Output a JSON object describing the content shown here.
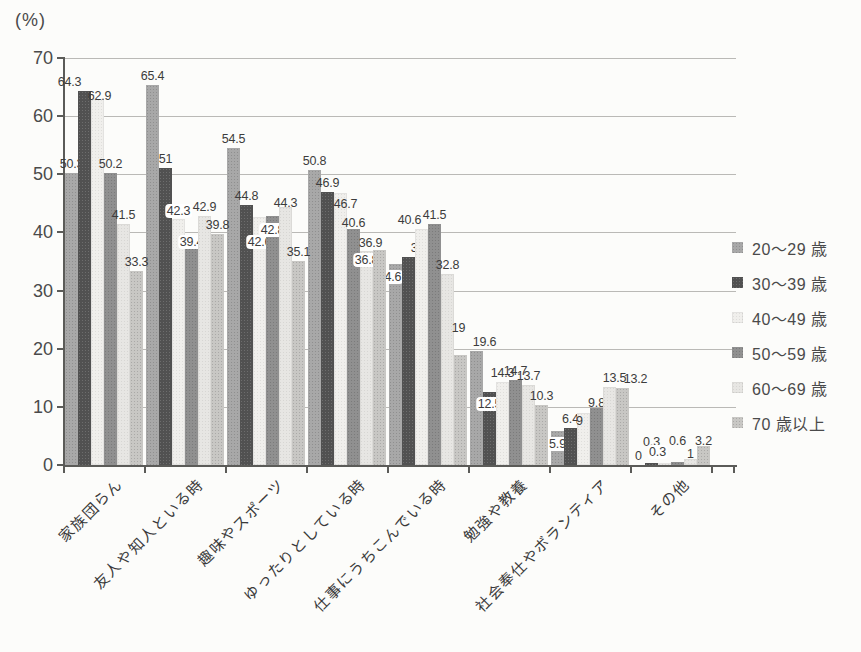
{
  "chart_data": {
    "type": "bar",
    "unit_label": "(%)",
    "categories": [
      "家族団らん",
      "友人や知人といる時",
      "趣味やスポーツ",
      "ゆったりとしている時",
      "仕事にうちこんでいる時",
      "勉強や教養",
      "社会奉仕やボランティア",
      "その他"
    ],
    "series": [
      {
        "name": "20〜29 歳",
        "color": "#a8a8a8",
        "values": [
          50.3,
          65.4,
          54.5,
          50.8,
          34.6,
          19.6,
          5.9,
          0
        ]
      },
      {
        "name": "30〜39 歳",
        "color": "#515151",
        "values": [
          64.3,
          51,
          44.8,
          46.9,
          35.7,
          12.5,
          6.4,
          0.3
        ]
      },
      {
        "name": "40〜49 歳",
        "color": "#f0efec",
        "values": [
          62.9,
          42.3,
          42.6,
          46.7,
          40.6,
          14.3,
          9,
          0.3
        ]
      },
      {
        "name": "50〜59 歳",
        "color": "#909090",
        "values": [
          50.2,
          39.4,
          42.8,
          40.6,
          41.5,
          14.7,
          9.8,
          0.6
        ]
      },
      {
        "name": "60〜69 歳",
        "color": "#e7e6e3",
        "values": [
          41.5,
          42.9,
          44.3,
          36.8,
          32.8,
          13.7,
          13.5,
          1
        ]
      },
      {
        "name": "70 歳以上",
        "color": "#c8c7c4",
        "values": [
          33.3,
          39.8,
          35.1,
          36.9,
          19,
          10.3,
          13.2,
          3.2
        ]
      }
    ],
    "ylim": [
      0,
      70
    ],
    "yticks": [
      0,
      10,
      20,
      30,
      40,
      50,
      60,
      70
    ],
    "grid": true,
    "legend_position": "right",
    "value_labels": true,
    "boxed_labels": [
      [
        2,
        1
      ],
      [
        3,
        1
      ],
      [
        2,
        2
      ],
      [
        3,
        2
      ],
      [
        4,
        3
      ],
      [
        0,
        4
      ],
      [
        1,
        5
      ],
      [
        0,
        6
      ],
      [
        2,
        7
      ]
    ],
    "raised_labels": [
      [
        1,
        7
      ],
      [
        3,
        7
      ]
    ],
    "label_offsets": [
      [
        1,
        0,
        -15,
        0
      ],
      [
        2,
        0,
        2,
        6
      ],
      [
        2,
        1,
        0,
        -9
      ],
      [
        3,
        1,
        0,
        5
      ],
      [
        2,
        2,
        0,
        24
      ],
      [
        3,
        2,
        0,
        13
      ],
      [
        4,
        2,
        0,
        5
      ],
      [
        2,
        3,
        5,
        20
      ],
      [
        3,
        3,
        0,
        3
      ],
      [
        4,
        3,
        0,
        8
      ],
      [
        5,
        3,
        -9,
        2
      ],
      [
        0,
        4,
        -6,
        12
      ],
      [
        1,
        4,
        14,
        0
      ],
      [
        2,
        4,
        -12,
        0
      ],
      [
        5,
        4,
        -2,
        -18
      ],
      [
        0,
        5,
        8,
        0
      ],
      [
        1,
        5,
        0,
        11
      ],
      [
        0,
        6,
        0,
        12
      ],
      [
        2,
        6,
        -4,
        17
      ],
      [
        3,
        6,
        0,
        4
      ],
      [
        4,
        6,
        5,
        0
      ],
      [
        5,
        6,
        13,
        0
      ],
      [
        2,
        7,
        -7,
        -12
      ],
      [
        4,
        7,
        0,
        4
      ],
      [
        5,
        7,
        0,
        4
      ]
    ]
  }
}
